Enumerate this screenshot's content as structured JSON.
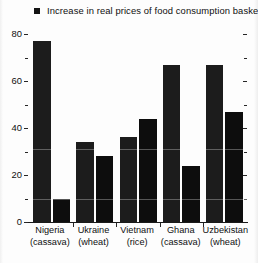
{
  "legend": {
    "marker": "square-marker",
    "label": "Increase in real prices of food consumption basket"
  },
  "chart_data": {
    "type": "bar",
    "title": "",
    "subtitle": "",
    "xlabel": "",
    "ylabel": "",
    "ylim": [
      0,
      80
    ],
    "yticks_major": [
      0,
      20,
      40,
      60,
      80
    ],
    "yticks_minor": [
      10,
      30,
      50,
      70
    ],
    "ytick_labels": [
      "0",
      "20",
      "40",
      "60",
      "80"
    ],
    "grid": false,
    "legend_position": "top",
    "categories": [
      "Nigeria (cassava)",
      "Ukraine (wheat)",
      "Vietnam (rice)",
      "Ghana (cassava)",
      "Uzbekistan (wheat)"
    ],
    "category_lines": [
      [
        "Nigeria",
        "(cassava)"
      ],
      [
        "Ukraine",
        "(wheat)"
      ],
      [
        "Vietnam",
        "(rice)"
      ],
      [
        "Ghana",
        "(cassava)"
      ],
      [
        "Uzbekistan",
        "(wheat)"
      ]
    ],
    "series": [
      {
        "name": "Increase in real prices of food consumption basket",
        "values": [
          77,
          34,
          36,
          67,
          67
        ]
      },
      {
        "name": "Second bar",
        "values": [
          10,
          28,
          44,
          24,
          47
        ]
      }
    ]
  },
  "colors": {
    "bar_a": "#1c1c1c",
    "bar_b": "#0d0d0d",
    "axis": "#1a1a1a",
    "text": "#0f0f0f",
    "background": "#fdfdfd"
  }
}
